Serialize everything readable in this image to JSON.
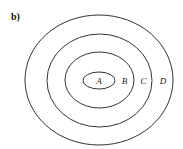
{
  "panel": {
    "label": "b)"
  },
  "diagram": {
    "type": "nested-ellipses",
    "stroke_color": "#333333",
    "regions": [
      {
        "label": "A",
        "role": "innermost"
      },
      {
        "label": "B",
        "role": "second"
      },
      {
        "label": "C",
        "role": "third"
      },
      {
        "label": "D",
        "role": "outermost"
      }
    ]
  }
}
